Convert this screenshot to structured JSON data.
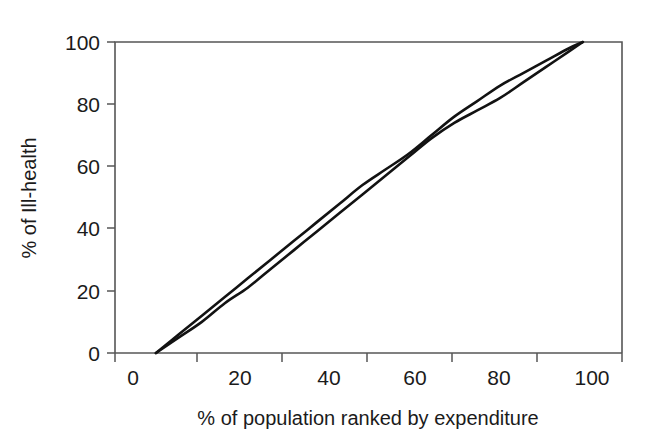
{
  "figure": {
    "background_color": "#ffffff",
    "line_color": "#121212",
    "axis_color": "#565656",
    "text_color": "#1b1b1b"
  },
  "chart_data": {
    "type": "line",
    "title": "",
    "xlabel": "% of population ranked by expenditure",
    "ylabel": "% of Ill-health",
    "xlim": [
      0,
      100
    ],
    "ylim": [
      0,
      100
    ],
    "xticks": [
      0,
      20,
      40,
      60,
      80,
      100
    ],
    "yticks": [
      0,
      20,
      40,
      60,
      80,
      100
    ],
    "xtick_labels": [
      "0",
      "20",
      "40",
      "60",
      "80",
      "100"
    ],
    "ytick_labels": [
      "0",
      "20",
      "40",
      "60",
      "80",
      "100"
    ],
    "x_minor_tick_interval": 10,
    "grid": false,
    "legend": null,
    "legend_position": "none",
    "annotations": [],
    "series": [
      {
        "name": "concentration-curve-upper",
        "x": [
          5,
          10,
          15,
          20,
          25,
          30,
          35,
          40,
          45,
          50,
          55,
          60,
          65,
          70,
          75,
          80,
          85,
          90,
          95,
          98
        ],
        "y": [
          0,
          6,
          12,
          18,
          24,
          30,
          36,
          42,
          48,
          54,
          59,
          64,
          70,
          76,
          81,
          86,
          90,
          94,
          98,
          100
        ]
      },
      {
        "name": "concentration-curve-lower",
        "x": [
          5,
          10,
          15,
          20,
          25,
          30,
          35,
          40,
          45,
          50,
          55,
          60,
          65,
          70,
          75,
          80,
          85,
          90,
          95,
          98
        ],
        "y": [
          0,
          5,
          10,
          16,
          21,
          27,
          33,
          39,
          45,
          51,
          57,
          63,
          69,
          74,
          78,
          82,
          87,
          92,
          97,
          100
        ]
      }
    ]
  },
  "axes": {
    "y_axis_title": "% of Ill-health",
    "x_axis_title": "% of population ranked by expenditure"
  }
}
